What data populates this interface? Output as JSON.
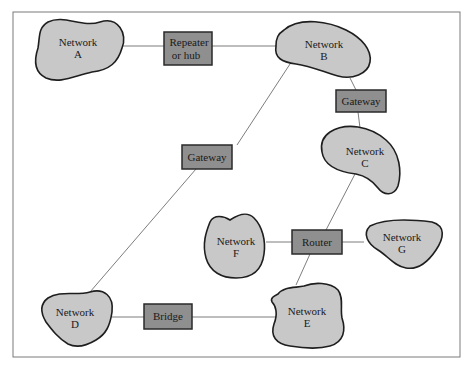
{
  "diagram": {
    "type": "network-interconnection",
    "networks": [
      {
        "id": "A",
        "line1": "Network",
        "line2": "A"
      },
      {
        "id": "B",
        "line1": "Network",
        "line2": "B"
      },
      {
        "id": "C",
        "line1": "Network",
        "line2": "C"
      },
      {
        "id": "D",
        "line1": "Network",
        "line2": "D"
      },
      {
        "id": "E",
        "line1": "Network",
        "line2": "E"
      },
      {
        "id": "F",
        "line1": "Network",
        "line2": "F"
      },
      {
        "id": "G",
        "line1": "Network",
        "line2": "G"
      }
    ],
    "devices": [
      {
        "id": "repeater",
        "line1": "Repeater",
        "line2": "or hub"
      },
      {
        "id": "gateway_bc",
        "line1": "Gateway"
      },
      {
        "id": "gateway_bd",
        "line1": "Gateway"
      },
      {
        "id": "router",
        "line1": "Router"
      },
      {
        "id": "bridge",
        "line1": "Bridge"
      }
    ],
    "connections": [
      [
        "Network A",
        "Repeater or hub",
        "Network B"
      ],
      [
        "Network B",
        "Gateway",
        "Network C"
      ],
      [
        "Network B",
        "Gateway",
        "Network D"
      ],
      [
        "Network C",
        "Router",
        "Network E"
      ],
      [
        "Network F",
        "Router",
        "Network G"
      ],
      [
        "Network D",
        "Bridge",
        "Network E"
      ]
    ]
  }
}
